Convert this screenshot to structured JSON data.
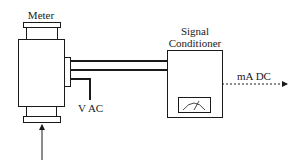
{
  "diagram": {
    "meter": {
      "label": "Meter"
    },
    "supply": {
      "label": "V AC"
    },
    "signal_conditioner": {
      "label_line1": "Signal",
      "label_line2": "Conditioner"
    },
    "output": {
      "label": "mA DC"
    }
  },
  "colors": {
    "stroke": "#1a1a1a",
    "background": "#ffffff"
  }
}
